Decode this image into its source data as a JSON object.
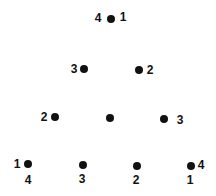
{
  "diagram": {
    "dots": [
      {
        "id": "r1c1",
        "x": 111,
        "y": 19
      },
      {
        "id": "r2c1",
        "x": 84,
        "y": 69
      },
      {
        "id": "r2c2",
        "x": 139,
        "y": 70
      },
      {
        "id": "r3c1",
        "x": 55,
        "y": 117
      },
      {
        "id": "r3c2",
        "x": 110,
        "y": 118
      },
      {
        "id": "r3c3",
        "x": 164,
        "y": 119
      },
      {
        "id": "r4c1",
        "x": 28,
        "y": 164
      },
      {
        "id": "r4c2",
        "x": 83,
        "y": 165
      },
      {
        "id": "r4c3",
        "x": 137,
        "y": 166
      },
      {
        "id": "r4c4",
        "x": 191,
        "y": 166
      }
    ],
    "labels": [
      {
        "text": "4",
        "x": 98,
        "y": 18
      },
      {
        "text": "1",
        "x": 123,
        "y": 17
      },
      {
        "text": "3",
        "x": 74,
        "y": 69
      },
      {
        "text": "2",
        "x": 150,
        "y": 70
      },
      {
        "text": "2",
        "x": 44,
        "y": 117
      },
      {
        "text": "3",
        "x": 180,
        "y": 120
      },
      {
        "text": "1",
        "x": 17,
        "y": 164
      },
      {
        "text": "4",
        "x": 201,
        "y": 165
      },
      {
        "text": "4",
        "x": 28,
        "y": 180
      },
      {
        "text": "3",
        "x": 82,
        "y": 179
      },
      {
        "text": "2",
        "x": 136,
        "y": 180
      },
      {
        "text": "1",
        "x": 190,
        "y": 180
      }
    ]
  }
}
